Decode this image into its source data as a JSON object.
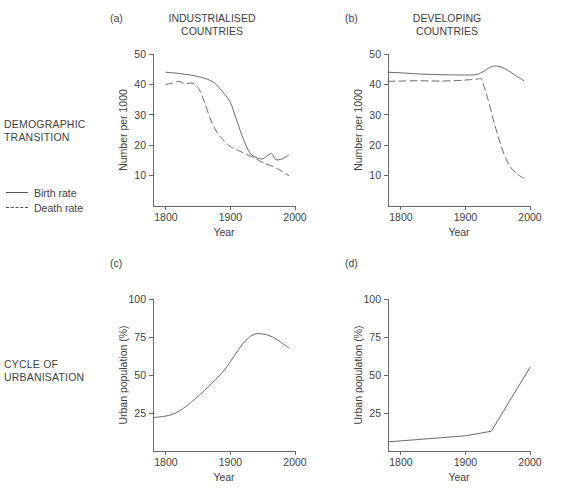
{
  "figure": {
    "row_labels": [
      {
        "id": "demographic",
        "text": "DEMOGRAPHIC\nTRANSITION"
      },
      {
        "id": "urbanisation",
        "text": "CYCLE OF\nURBANISATION"
      }
    ],
    "legend": {
      "position": "left-middle",
      "entries": [
        {
          "label": "Birth rate",
          "style": "solid"
        },
        {
          "label": "Death rate",
          "style": "dashed"
        }
      ]
    }
  },
  "chart_data": [
    {
      "id": "a",
      "type": "line",
      "tag": "(a)",
      "title": "INDUSTRIALISED\nCOUNTRIES",
      "xlabel": "Year",
      "ylabel": "Number per 1000",
      "xlim": [
        1780,
        2000
      ],
      "ylim": [
        0,
        50
      ],
      "xticks": [
        1800,
        1900,
        2000
      ],
      "xticklabels": [
        "1800",
        "1900",
        "2000"
      ],
      "yticks": [
        10,
        20,
        30,
        40,
        50
      ],
      "yticklabels": [
        "10",
        "20",
        "30",
        "40",
        "50"
      ],
      "grid": false,
      "series": [
        {
          "name": "Birth rate",
          "style": "solid",
          "x": [
            1800,
            1820,
            1840,
            1860,
            1875,
            1890,
            1900,
            1910,
            1920,
            1930,
            1940,
            1950,
            1960,
            1965,
            1970,
            1980,
            1990
          ],
          "values": [
            44,
            43.6,
            43,
            42,
            40.5,
            37,
            34,
            28,
            22,
            17.5,
            16,
            15.5,
            17,
            17,
            15.3,
            15.5,
            16.8
          ]
        },
        {
          "name": "Death rate",
          "style": "dashed",
          "x": [
            1800,
            1810,
            1820,
            1830,
            1840,
            1850,
            1860,
            1870,
            1880,
            1890,
            1900,
            1915,
            1930,
            1940,
            1950,
            1960,
            1975,
            1990
          ],
          "values": [
            40,
            40.4,
            41,
            40.2,
            40.4,
            39,
            34,
            28,
            24,
            21.5,
            19.5,
            18,
            16.5,
            15.5,
            14.2,
            13.5,
            12,
            10
          ]
        }
      ]
    },
    {
      "id": "b",
      "type": "line",
      "tag": "(b)",
      "title": "DEVELOPING\nCOUNTRIES",
      "xlabel": "Year",
      "ylabel": "Number per 1000",
      "xlim": [
        1780,
        2000
      ],
      "ylim": [
        0,
        50
      ],
      "xticks": [
        1800,
        1900,
        2000
      ],
      "xticklabels": [
        "1800",
        "1900",
        "2000"
      ],
      "yticks": [
        10,
        20,
        30,
        40,
        50
      ],
      "yticklabels": [
        "10",
        "20",
        "30",
        "40",
        "50"
      ],
      "grid": false,
      "series": [
        {
          "name": "Birth rate",
          "style": "solid",
          "x": [
            1780,
            1800,
            1830,
            1860,
            1890,
            1910,
            1920,
            1930,
            1940,
            1950,
            1960,
            1970,
            1980,
            1990
          ],
          "values": [
            44,
            43.8,
            43.4,
            43.2,
            43.1,
            43.1,
            43.4,
            44.5,
            45.8,
            46,
            45.3,
            44,
            42.6,
            41.3
          ]
        },
        {
          "name": "Death rate",
          "style": "dashed",
          "x": [
            1780,
            1800,
            1830,
            1860,
            1890,
            1910,
            1920,
            1925,
            1935,
            1945,
            1955,
            1965,
            1975,
            1985,
            1990
          ],
          "values": [
            41,
            41.1,
            41.2,
            41.1,
            41.3,
            41.6,
            41.8,
            41.5,
            35,
            27,
            20,
            14.5,
            11.5,
            9.8,
            9.2
          ]
        }
      ]
    },
    {
      "id": "c",
      "type": "line",
      "tag": "(c)",
      "title": "",
      "xlabel": "Year",
      "ylabel": "Urban population (%)",
      "xlim": [
        1780,
        2000
      ],
      "ylim": [
        0,
        100
      ],
      "xticks": [
        1800,
        1900,
        2000
      ],
      "xticklabels": [
        "1800",
        "1900",
        "2000"
      ],
      "yticks": [
        25,
        50,
        75,
        100
      ],
      "yticklabels": [
        "25",
        "50",
        "75",
        "100"
      ],
      "grid": false,
      "series": [
        {
          "name": "Urban population",
          "style": "solid",
          "x": [
            1780,
            1800,
            1815,
            1830,
            1850,
            1870,
            1890,
            1905,
            1920,
            1935,
            1950,
            1965,
            1980,
            1990
          ],
          "values": [
            22,
            23,
            25,
            29,
            36,
            44,
            53,
            62,
            71,
            76.5,
            77,
            75,
            71,
            68
          ]
        }
      ]
    },
    {
      "id": "d",
      "type": "line",
      "tag": "(d)",
      "title": "",
      "xlabel": "Year",
      "ylabel": "Urban population (%)",
      "xlim": [
        1780,
        2000
      ],
      "ylim": [
        0,
        100
      ],
      "xticks": [
        1800,
        1900,
        2000
      ],
      "xticklabels": [
        "1800",
        "1900",
        "2000"
      ],
      "yticks": [
        25,
        50,
        75,
        100
      ],
      "yticklabels": [
        "25",
        "50",
        "75",
        "100"
      ],
      "grid": false,
      "series": [
        {
          "name": "Urban population",
          "style": "solid",
          "x": [
            1780,
            1900,
            1940,
            2000
          ],
          "values": [
            6,
            10,
            13,
            55
          ]
        }
      ]
    }
  ]
}
